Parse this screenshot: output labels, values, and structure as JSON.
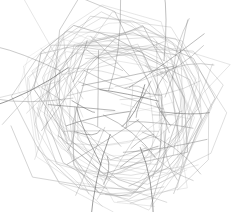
{
  "image": {
    "description": "Abstract tangled scribble of gray looping lines on white background",
    "background": "#ffffff",
    "stroke_colors": [
      "#b8b8b8",
      "#9a9a9a",
      "#7a7a7a",
      "#555555"
    ],
    "bounds": {
      "x": 12,
      "y": 22,
      "width": 212,
      "height": 172
    }
  }
}
